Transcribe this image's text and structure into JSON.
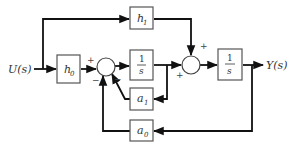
{
  "diagram": {
    "input_label": "U(s)",
    "output_label": "Y(s)",
    "blocks": {
      "h0": {
        "label": "h",
        "sub": "0"
      },
      "h1": {
        "label": "h",
        "sub": "1"
      },
      "integrator1": {
        "num": "1",
        "den": "s"
      },
      "integrator2": {
        "num": "1",
        "den": "s"
      },
      "a1": {
        "label": "a",
        "sub": "1"
      },
      "a0": {
        "label": "a",
        "sub": "0"
      }
    },
    "sum1_signs": {
      "top": "+",
      "bottom_left": "−",
      "bottom_right": "−"
    },
    "sum2_signs": {
      "top": "+",
      "left": "+"
    }
  }
}
